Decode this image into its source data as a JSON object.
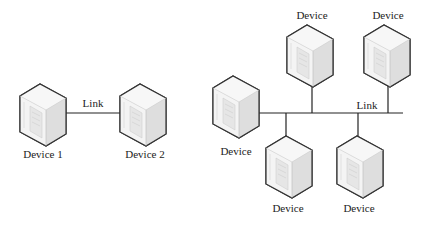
{
  "point_to_point": {
    "devices": [
      {
        "label": "Device 1"
      },
      {
        "label": "Device 2"
      }
    ],
    "link_label": "Link"
  },
  "bus": {
    "devices": [
      {
        "label": "Device",
        "position": "left"
      },
      {
        "label": "Device",
        "position": "top-1"
      },
      {
        "label": "Device",
        "position": "top-2"
      },
      {
        "label": "Device",
        "position": "bottom-1"
      },
      {
        "label": "Device",
        "position": "bottom-2"
      }
    ],
    "link_label": "Link"
  },
  "colors": {
    "line": "#222222",
    "server_face": "#f2f2f2",
    "server_side": "#dcdcdc",
    "server_outline": "#333333"
  }
}
